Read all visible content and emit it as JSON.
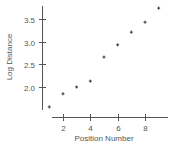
{
  "chart_data": {
    "type": "scatter",
    "title": "",
    "xlabel": "Position Number",
    "ylabel": "Log Distance",
    "x": [
      1,
      2,
      3,
      4,
      5,
      6,
      7,
      8,
      9
    ],
    "series": [
      {
        "name": "Log Distance",
        "values": [
          1.56,
          1.85,
          2.0,
          2.13,
          2.66,
          2.93,
          3.21,
          3.43,
          3.74
        ]
      }
    ],
    "xticks": [
      "2",
      "4",
      "6",
      "8"
    ],
    "yticks": [
      "2.0",
      "2.5",
      "3.0",
      "3.5"
    ],
    "xlim": [
      0.2,
      10.2
    ],
    "ylim": [
      1.5,
      3.8
    ],
    "grid": false,
    "legend": "none",
    "marker": "plus",
    "colors": {
      "axis": "#555555",
      "marker": "#333333",
      "text": "#555555"
    }
  }
}
